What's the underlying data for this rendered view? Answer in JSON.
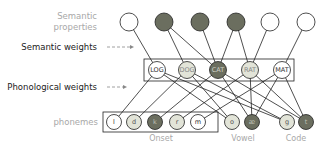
{
  "labels": {
    "semantic_properties_line1": "Semantic",
    "semantic_properties_line2": "properties",
    "semantic_weights": "Semantic weights",
    "phonological_weights": "Phonological weights",
    "phonemes": "phonemes",
    "onset": "Onset",
    "vowel": "Vowel",
    "code": "Code"
  },
  "colors": {
    "active_dark": "#6b6e5f",
    "partial_light": "#e2e4d8",
    "inactive": "#ffffff",
    "stroke": "#222222",
    "grey_text": "#a8a8a8"
  },
  "semantic_nodes": [
    {
      "id": "s1",
      "state": "inactive"
    },
    {
      "id": "s2",
      "state": "active"
    },
    {
      "id": "s3",
      "state": "active"
    },
    {
      "id": "s4",
      "state": "active"
    },
    {
      "id": "s5",
      "state": "inactive"
    },
    {
      "id": "s6",
      "state": "inactive"
    }
  ],
  "words": [
    {
      "label": "LOG",
      "state": "inactive"
    },
    {
      "label": "DOG",
      "state": "partial"
    },
    {
      "label": "CAT",
      "state": "active"
    },
    {
      "label": "RAT",
      "state": "partial"
    },
    {
      "label": "MAT",
      "state": "inactive"
    }
  ],
  "phonemes": {
    "onset": [
      {
        "label": "l",
        "state": "inactive"
      },
      {
        "label": "d",
        "state": "partial"
      },
      {
        "label": "k",
        "state": "active"
      },
      {
        "label": "r",
        "state": "partial"
      },
      {
        "label": "m",
        "state": "inactive"
      }
    ],
    "vowel": [
      {
        "label": "o",
        "state": "partial"
      },
      {
        "label": "æ",
        "state": "active"
      }
    ],
    "code": [
      {
        "label": "g",
        "state": "partial"
      },
      {
        "label": "t",
        "state": "active"
      }
    ]
  }
}
